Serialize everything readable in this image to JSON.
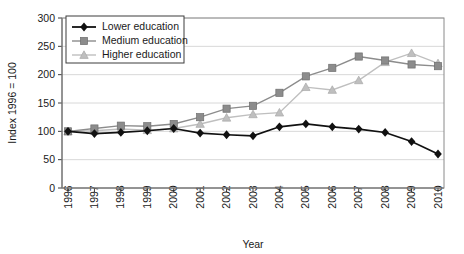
{
  "chart_data": {
    "type": "line",
    "title": "",
    "xlabel": "Year",
    "ylabel": "Index 1996 = 100",
    "categories": [
      "1996",
      "1997",
      "1998",
      "1999",
      "2000",
      "2001",
      "2002",
      "2003",
      "2004",
      "2005",
      "2006",
      "2007",
      "2008",
      "2009",
      "2010"
    ],
    "x": [
      1996,
      1997,
      1998,
      1999,
      2000,
      2001,
      2002,
      2003,
      2004,
      2005,
      2006,
      2007,
      2008,
      2009,
      2010
    ],
    "ylim": [
      0,
      300
    ],
    "yticks": [
      0,
      50,
      100,
      150,
      200,
      250,
      300
    ],
    "grid": true,
    "legend_position": "top-left",
    "series": [
      {
        "name": "Lower education",
        "marker": "diamond",
        "color": "#111111",
        "values": [
          100,
          96,
          98,
          101,
          105,
          97,
          94,
          92,
          108,
          113,
          108,
          104,
          98,
          82,
          60
        ]
      },
      {
        "name": "Medium education",
        "marker": "square",
        "color": "#8c8c8c",
        "values": [
          100,
          105,
          110,
          109,
          113,
          125,
          140,
          145,
          168,
          197,
          212,
          232,
          225,
          218,
          215
        ]
      },
      {
        "name": "Higher education",
        "marker": "triangle",
        "color": "#bfbfbf",
        "values": [
          100,
          101,
          104,
          102,
          105,
          113,
          124,
          130,
          133,
          178,
          173,
          190,
          222,
          238,
          220
        ]
      }
    ]
  },
  "legend": {
    "items": [
      {
        "label": "Lower education"
      },
      {
        "label": "Medium education"
      },
      {
        "label": "Higher education"
      }
    ]
  },
  "axes": {
    "y_title": "Index 1996 = 100",
    "x_title": "Year"
  }
}
